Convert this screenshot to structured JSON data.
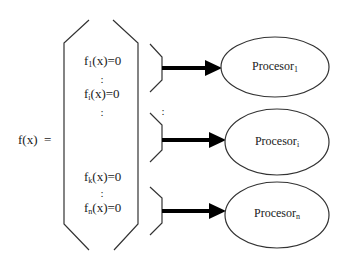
{
  "diagram": {
    "lhs": "f(x)  =",
    "equations": [
      {
        "base": "f",
        "sub": "1",
        "rest": "(x)=0"
      },
      {
        "base": "f",
        "sub": "i",
        "rest": "(x)=0"
      },
      {
        "base": "f",
        "sub": "k",
        "rest": "(x)=0"
      },
      {
        "base": "f",
        "sub": "n",
        "rest": "(x)=0"
      }
    ],
    "ellipsis": ":",
    "processors": [
      {
        "base": "Procesor",
        "sub": "1"
      },
      {
        "base": "Procesor",
        "sub": "i"
      },
      {
        "base": "Procesor",
        "sub": "n"
      }
    ],
    "colors": {
      "stroke": "#333333",
      "arrow": "#000000",
      "background": "#ffffff"
    }
  }
}
